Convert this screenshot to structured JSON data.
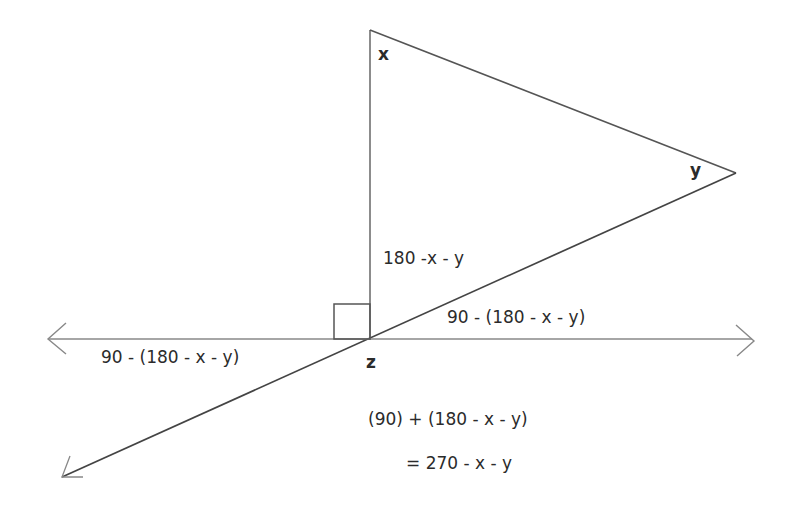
{
  "diagram": {
    "type": "geometry-angle-diagram",
    "vertices": {
      "x": "x",
      "y": "y",
      "z": "z"
    },
    "labels": {
      "interior_angle": "180 -x - y",
      "upper_right_angle": "90 - (180 - x - y)",
      "lower_left_angle": "90 - (180 - x - y)",
      "sum_expression": "(90) + (180 - x - y)",
      "result_expression": "= 270 - x - y"
    },
    "elements": {
      "right_angle_marker": "right-angle-square",
      "horizontal_line": "double-headed-arrow",
      "diagonal_line": "line-with-arrow-lower-left"
    },
    "colors": {
      "line": "#555555",
      "text": "#2b2b2b",
      "background": "#ffffff"
    }
  }
}
